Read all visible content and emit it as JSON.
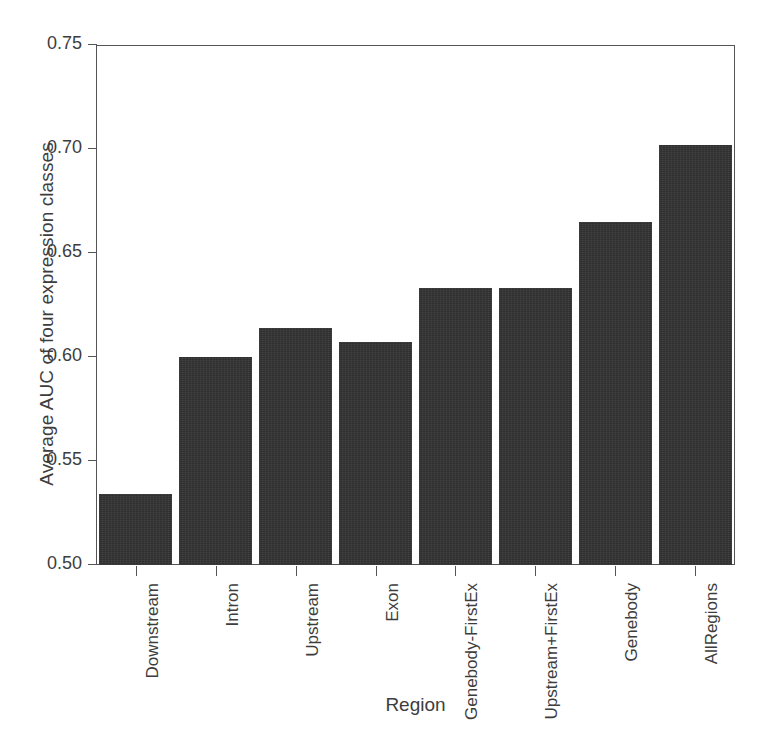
{
  "chart_data": {
    "type": "bar",
    "title": "",
    "xlabel": "Region",
    "ylabel": "Average AUC of four expression classes",
    "categories": [
      "Downstream",
      "Intron",
      "Upstream",
      "Exon",
      "Genebody-FirstEx",
      "Upstream+FirstEx",
      "Genebody",
      "AllRegions"
    ],
    "values": [
      0.534,
      0.6,
      0.614,
      0.607,
      0.633,
      0.633,
      0.665,
      0.702
    ],
    "ylim": [
      0.5,
      0.75
    ],
    "yticks": [
      "0.50",
      "0.55",
      "0.60",
      "0.65",
      "0.70",
      "0.75"
    ],
    "ytick_values": [
      0.5,
      0.55,
      0.6,
      0.65,
      0.7,
      0.75
    ],
    "grid": false,
    "legend": null,
    "bar_color": "#333333",
    "axis_color": "#555555"
  }
}
